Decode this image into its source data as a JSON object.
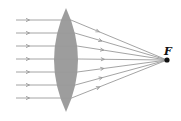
{
  "diagram": {
    "focal_label": "F",
    "colors": {
      "lens_fill": "#8c8c8c",
      "ray": "#9a9a9a",
      "focal_point": "#111111"
    },
    "lens": {
      "cx": 66,
      "top": 8,
      "bottom": 112,
      "half_width": 12
    },
    "focal_point": {
      "x": 167,
      "y": 60
    },
    "rays_y": [
      20,
      33,
      46,
      59,
      72,
      85,
      98
    ],
    "ray_start_x": 16
  }
}
